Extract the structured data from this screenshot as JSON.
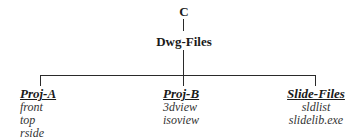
{
  "tree": {
    "root": {
      "label": "C"
    },
    "child": {
      "label": "Dwg-Files"
    },
    "branches": [
      {
        "label": "Proj-A",
        "items": [
          "front",
          "top",
          "rside"
        ]
      },
      {
        "label": "Proj-B",
        "items": [
          "3dview",
          "isoview"
        ]
      },
      {
        "label": "Slide-Files",
        "items": [
          "sldlist",
          "slidelib.exe"
        ]
      }
    ]
  }
}
